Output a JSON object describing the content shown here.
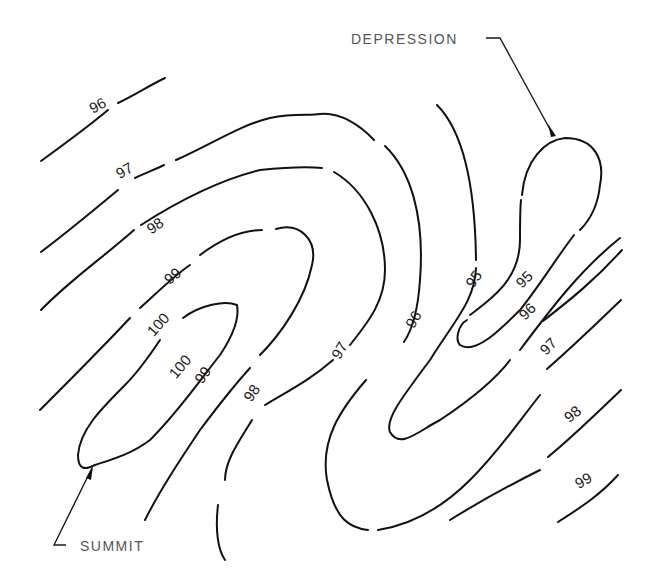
{
  "figure": {
    "type": "topographic contour map",
    "background": "#ffffff",
    "line_color": "#111111",
    "callouts": {
      "depression": "DEPRESSION",
      "summit": "SUMMIT"
    },
    "contour_labels": [
      {
        "id": "l96a",
        "text": "96",
        "x": 100,
        "y": 110,
        "angle": -28
      },
      {
        "id": "l97a",
        "text": "97",
        "x": 127,
        "y": 175,
        "angle": -30
      },
      {
        "id": "l98a",
        "text": "98",
        "x": 158,
        "y": 230,
        "angle": -35
      },
      {
        "id": "l99a",
        "text": "99",
        "x": 176,
        "y": 280,
        "angle": -40
      },
      {
        "id": "l100a",
        "text": "100",
        "x": 162,
        "y": 328,
        "angle": -48
      },
      {
        "id": "l100b",
        "text": "100",
        "x": 184,
        "y": 370,
        "angle": -50
      },
      {
        "id": "l99b",
        "text": "99",
        "x": 207,
        "y": 378,
        "angle": -55
      },
      {
        "id": "l98b",
        "text": "98",
        "x": 256,
        "y": 396,
        "angle": -55
      },
      {
        "id": "l97b",
        "text": "97",
        "x": 344,
        "y": 353,
        "angle": -60
      },
      {
        "id": "l96b",
        "text": "96",
        "x": 418,
        "y": 322,
        "angle": -60
      },
      {
        "id": "l95a",
        "text": "95",
        "x": 478,
        "y": 282,
        "angle": -55
      },
      {
        "id": "l95b",
        "text": "95",
        "x": 528,
        "y": 283,
        "angle": -45
      },
      {
        "id": "l96c",
        "text": "96",
        "x": 531,
        "y": 315,
        "angle": -45
      },
      {
        "id": "l97c",
        "text": "97",
        "x": 552,
        "y": 350,
        "angle": -45
      },
      {
        "id": "l98c",
        "text": "98",
        "x": 576,
        "y": 418,
        "angle": -40
      },
      {
        "id": "l99c",
        "text": "99",
        "x": 586,
        "y": 485,
        "angle": -30
      }
    ],
    "contour_values": [
      95,
      96,
      97,
      98,
      99,
      100
    ]
  }
}
